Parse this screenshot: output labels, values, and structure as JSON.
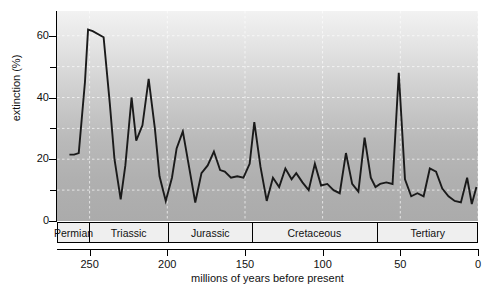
{
  "chart_data": {
    "type": "line",
    "title": "",
    "xlabel": "millions of years before present",
    "ylabel": "extinction (%)",
    "xlim": [
      271,
      0
    ],
    "ylim": [
      0,
      68
    ],
    "x_reversed": true,
    "grid": true,
    "legend": "none",
    "y_ticks_major": [
      0,
      20,
      40,
      60
    ],
    "y_ticks_minor": [
      10,
      30,
      50
    ],
    "x_ticks": [
      250,
      200,
      150,
      100,
      50,
      0
    ],
    "line_color": "#1a1a1a",
    "background_gradient": [
      "#f2f2f2",
      "#ababab"
    ],
    "series_name": "extinction rate",
    "x": [
      263,
      260,
      257,
      253,
      251,
      248,
      241,
      237,
      234,
      230,
      227,
      223,
      220,
      216,
      212,
      208,
      205,
      201,
      197,
      194,
      190,
      186,
      182,
      178,
      174,
      170,
      166,
      163,
      159,
      155,
      151,
      147,
      144,
      140,
      136,
      132,
      128,
      124,
      120,
      117,
      113,
      109,
      105,
      101,
      97,
      93,
      89,
      85,
      81,
      77,
      73,
      69,
      66,
      63,
      59,
      55,
      51,
      47,
      43,
      39,
      35,
      31,
      27,
      23,
      19,
      15,
      11,
      7,
      4,
      1
    ],
    "y": [
      21.5,
      21.5,
      22.0,
      45.0,
      62.0,
      61.5,
      59.5,
      38.0,
      20.0,
      7.0,
      18.0,
      40.0,
      26.0,
      31.0,
      46.0,
      30.0,
      14.5,
      6.5,
      14.0,
      23.5,
      29.0,
      17.5,
      6.0,
      15.5,
      18.0,
      22.5,
      16.5,
      16.0,
      14.0,
      14.5,
      14.0,
      18.5,
      32.0,
      17.5,
      6.5,
      14.0,
      11.0,
      17.0,
      13.5,
      15.5,
      12.5,
      10.0,
      18.5,
      11.5,
      12.0,
      10.0,
      9.0,
      22.0,
      12.0,
      9.5,
      27.0,
      14.0,
      11.0,
      12.0,
      12.5,
      12.0,
      48.0,
      13.5,
      8.0,
      9.0,
      8.0,
      17.0,
      16.0,
      10.5,
      8.0,
      6.5,
      6.0,
      14.0,
      5.5,
      11.0
    ],
    "periods": [
      {
        "name": "Permian",
        "start": 271,
        "end": 251
      },
      {
        "name": "Triassic",
        "start": 251,
        "end": 200
      },
      {
        "name": "Jurassic",
        "start": 200,
        "end": 146
      },
      {
        "name": "Cretaceous",
        "start": 146,
        "end": 66
      },
      {
        "name": "Tertiary",
        "start": 66,
        "end": 0
      }
    ]
  },
  "axes": {
    "y_title": "extinction (%)",
    "x_title": "millions of years before present",
    "y_labels": [
      "60",
      "40",
      "20",
      "0"
    ],
    "x_labels": [
      "250",
      "200",
      "150",
      "100",
      "50",
      "0"
    ]
  },
  "periods": {
    "labels": [
      "Permian",
      "Triassic",
      "Jurassic",
      "Cretaceous",
      "Tertiary"
    ]
  }
}
